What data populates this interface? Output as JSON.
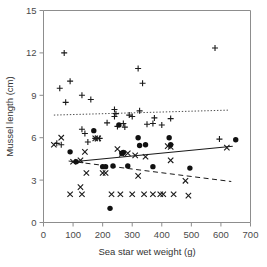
{
  "chart_data": {
    "type": "scatter",
    "title": "",
    "xlabel": "Sea star wet weight (g)",
    "ylabel": "Mussel length (cm)",
    "xlim": [
      0,
      700
    ],
    "ylim": [
      0,
      15
    ],
    "xticks": [
      0,
      100,
      200,
      300,
      400,
      500,
      600,
      700
    ],
    "yticks": [
      0,
      3,
      6,
      9,
      12,
      15
    ],
    "xtick_labels": [
      "0",
      "100",
      "200",
      "300",
      "400",
      "500",
      "600",
      "700"
    ],
    "ytick_labels": [
      "0",
      "3",
      "6",
      "9",
      "12",
      "15"
    ],
    "grid": false,
    "legend": "none",
    "marker_colors": {
      "plus": "#1a1a1a",
      "cross": "#1a1a1a",
      "circle": "#111111"
    },
    "series": [
      {
        "name": "plus",
        "marker": "plus",
        "points": [
          [
            55,
            9.5
          ],
          [
            70,
            12.0
          ],
          [
            75,
            8.5
          ],
          [
            90,
            10.0
          ],
          [
            130,
            9.0
          ],
          [
            160,
            8.7
          ],
          [
            45,
            5.6
          ],
          [
            60,
            5.5
          ],
          [
            130,
            6.6
          ],
          [
            140,
            6.3
          ],
          [
            150,
            5.7
          ],
          [
            175,
            5.95
          ],
          [
            190,
            5.95
          ],
          [
            215,
            7.05
          ],
          [
            240,
            8.0
          ],
          [
            240,
            7.5
          ],
          [
            245,
            7.7
          ],
          [
            250,
            6.8
          ],
          [
            270,
            7.0
          ],
          [
            275,
            6.75
          ],
          [
            290,
            7.6
          ],
          [
            300,
            7.5
          ],
          [
            320,
            10.9
          ],
          [
            325,
            7.9
          ],
          [
            335,
            9.85
          ],
          [
            350,
            6.95
          ],
          [
            370,
            7.0
          ],
          [
            375,
            7.4
          ],
          [
            400,
            6.9
          ],
          [
            430,
            7.35
          ],
          [
            580,
            12.35
          ],
          [
            595,
            5.9
          ]
        ]
      },
      {
        "name": "cross",
        "marker": "x",
        "points": [
          [
            35,
            5.5
          ],
          [
            60,
            6.0
          ],
          [
            100,
            4.3
          ],
          [
            125,
            4.4
          ],
          [
            140,
            5.0
          ],
          [
            145,
            3.5
          ],
          [
            200,
            3.5
          ],
          [
            175,
            5.95
          ],
          [
            185,
            5.95
          ],
          [
            250,
            5.2
          ],
          [
            265,
            4.85
          ],
          [
            285,
            4.9
          ],
          [
            310,
            4.75
          ],
          [
            320,
            3.3
          ],
          [
            345,
            4.65
          ],
          [
            420,
            5.4
          ],
          [
            430,
            5.35
          ],
          [
            430,
            4.4
          ],
          [
            480,
            2.95
          ],
          [
            620,
            5.3
          ],
          [
            90,
            2.0
          ],
          [
            125,
            2.5
          ],
          [
            130,
            2.0
          ],
          [
            210,
            3.5
          ],
          [
            230,
            2.0
          ],
          [
            260,
            2.0
          ],
          [
            300,
            2.0
          ],
          [
            340,
            2.0
          ],
          [
            370,
            2.0
          ],
          [
            395,
            2.0
          ],
          [
            405,
            2.0
          ],
          [
            440,
            2.0
          ],
          [
            490,
            1.9
          ]
        ]
      },
      {
        "name": "circle",
        "marker": "o",
        "points": [
          [
            90,
            5.0
          ],
          [
            110,
            4.3
          ],
          [
            170,
            6.5
          ],
          [
            200,
            3.95
          ],
          [
            210,
            3.95
          ],
          [
            225,
            1.0
          ],
          [
            235,
            4.0
          ],
          [
            255,
            6.9
          ],
          [
            265,
            4.9
          ],
          [
            270,
            4.95
          ],
          [
            285,
            4.0
          ],
          [
            320,
            6.0
          ],
          [
            325,
            5.45
          ],
          [
            345,
            5.5
          ],
          [
            370,
            3.95
          ],
          [
            425,
            6.0
          ],
          [
            430,
            5.5
          ],
          [
            495,
            3.85
          ],
          [
            650,
            5.85
          ]
        ]
      }
    ],
    "trend_lines": [
      {
        "name": "dotted-trend",
        "style": "dotted",
        "x_start": 35,
        "y_start": 7.6,
        "x_end": 625,
        "y_end": 7.95
      },
      {
        "name": "solid-trend",
        "style": "solid",
        "x_start": 100,
        "y_start": 4.3,
        "x_end": 640,
        "y_end": 5.4
      },
      {
        "name": "dashed-trend",
        "style": "dashed",
        "x_start": 85,
        "y_start": 4.35,
        "x_end": 635,
        "y_end": 2.9
      }
    ]
  }
}
